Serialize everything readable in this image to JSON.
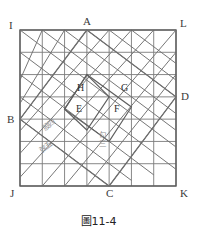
{
  "figure": {
    "caption": "圖11-4",
    "outer_square_corners": [
      {
        "id": "I",
        "label": "I",
        "position": "top-left"
      },
      {
        "id": "L",
        "label": "L",
        "position": "top-right"
      },
      {
        "id": "K",
        "label": "K",
        "position": "bottom-right"
      },
      {
        "id": "J",
        "label": "J",
        "position": "bottom-left"
      }
    ],
    "inscribed_square_vertices": [
      {
        "id": "A",
        "label": "A",
        "position": "top"
      },
      {
        "id": "D",
        "label": "D",
        "position": "right"
      },
      {
        "id": "C",
        "label": "C",
        "position": "bottom"
      },
      {
        "id": "B",
        "label": "B",
        "position": "left"
      }
    ],
    "inner_region_labels": [
      {
        "id": "E",
        "label": "E"
      },
      {
        "id": "F",
        "label": "F"
      },
      {
        "id": "G",
        "label": "G"
      },
      {
        "id": "H",
        "label": "H"
      }
    ],
    "annotations": [
      {
        "id": "gu-si",
        "label": "股四"
      },
      {
        "id": "xian-wu",
        "label": "弦五"
      },
      {
        "id": "gou-san",
        "label": "勾三"
      }
    ],
    "grid": {
      "columns": 7,
      "rows": 7
    },
    "colors": {
      "grid_line": "#7a7a7a",
      "diagonal_line": "#6f6f6f",
      "outer_border": "#5a5a5a",
      "label_text": "#3a3a3a",
      "annotation_text": "#8f8f8f",
      "caption_text": "#222222",
      "background": "#ffffff"
    }
  }
}
